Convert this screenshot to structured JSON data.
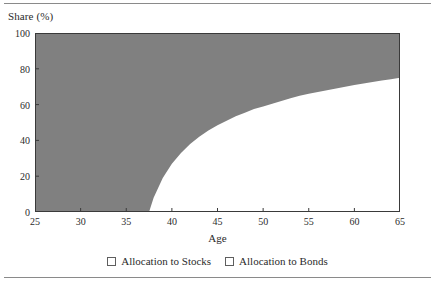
{
  "chart_data": {
    "type": "area",
    "title": "",
    "subtitle": "",
    "xlabel": "Age",
    "ylabel": "Share (%)",
    "xlim": [
      25,
      65
    ],
    "ylim": [
      0,
      100
    ],
    "xticks": [
      25,
      30,
      35,
      40,
      45,
      50,
      55,
      60,
      65
    ],
    "yticks": [
      0,
      20,
      40,
      60,
      80,
      100
    ],
    "grid": false,
    "legend_position": "bottom-center",
    "stacked": true,
    "x": [
      25,
      26,
      27,
      28,
      29,
      30,
      31,
      32,
      33,
      34,
      35,
      36,
      37,
      37.5,
      38,
      39,
      40,
      41,
      42,
      43,
      44,
      45,
      46,
      47,
      48,
      49,
      50,
      51,
      52,
      53,
      54,
      55,
      56,
      57,
      58,
      59,
      60,
      61,
      62,
      63,
      64,
      65
    ],
    "series": [
      {
        "name": "Allocation to Stocks",
        "color": "#808080",
        "values": [
          100,
          100,
          100,
          100,
          100,
          100,
          100,
          100,
          100,
          100,
          100,
          100,
          100,
          100,
          99,
          96,
          92.5,
          88.5,
          85,
          82,
          79.5,
          77,
          74.5,
          72.5,
          70.5,
          69,
          67.5,
          66,
          65,
          63.5,
          62.5,
          61.5,
          60.5,
          59.5,
          58.5,
          57.5,
          56.5,
          55.5,
          54.5,
          53.5,
          52.5,
          51.5
        ]
      },
      {
        "name": "Allocation to Bonds",
        "color": "#ffffff",
        "values": [
          0,
          0,
          0,
          0,
          0,
          0,
          0,
          0,
          0,
          0,
          0,
          0,
          0,
          0,
          1,
          4,
          7.5,
          11.5,
          15,
          18,
          20.5,
          23,
          25.5,
          27.5,
          29.5,
          31,
          32.5,
          34,
          35,
          36.5,
          37.5,
          38.5,
          39.5,
          40.5,
          41.5,
          42.5,
          43.5,
          44.5,
          45.5,
          46.5,
          47.5,
          48.5
        ]
      }
    ],
    "boundary_note": "Gray stocks region lies above the rising boundary curve; boundary reaches 0% at age 37.5 and about 75% at age 65.",
    "boundary_curve": {
      "x": [
        25,
        30,
        35,
        36,
        37,
        37.5,
        38,
        39,
        40,
        41,
        42,
        43,
        44,
        45,
        46,
        47,
        48,
        49,
        50,
        51,
        52,
        53,
        54,
        55,
        56,
        57,
        58,
        59,
        60,
        61,
        62,
        63,
        64,
        65
      ],
      "y": [
        0,
        0,
        0,
        0,
        0,
        0,
        8,
        19,
        27,
        33,
        38,
        42,
        45.5,
        48.5,
        51,
        53.5,
        55.5,
        57.5,
        59,
        60.5,
        62,
        63.5,
        65,
        66,
        67,
        68,
        69,
        70,
        71,
        71.8,
        72.6,
        73.4,
        74.2,
        75
      ]
    }
  },
  "axes": {
    "y_label": "Share (%)",
    "x_label": "Age",
    "y_tick_labels": [
      "100",
      "80",
      "60",
      "40",
      "20",
      "0"
    ],
    "x_tick_labels": [
      "25",
      "30",
      "35",
      "40",
      "45",
      "50",
      "55",
      "60",
      "65"
    ]
  },
  "legend": {
    "items": [
      {
        "label": "Allocation to Stocks",
        "swatch": "filled-gray-square"
      },
      {
        "label": "Allocation to Bonds",
        "swatch": "hollow-white-square"
      }
    ]
  },
  "colors": {
    "stocks_fill": "#808080",
    "bonds_fill": "#ffffff",
    "axis": "#3a3a3a",
    "rule": "#8a8a8a",
    "text": "#2b2b2b"
  }
}
